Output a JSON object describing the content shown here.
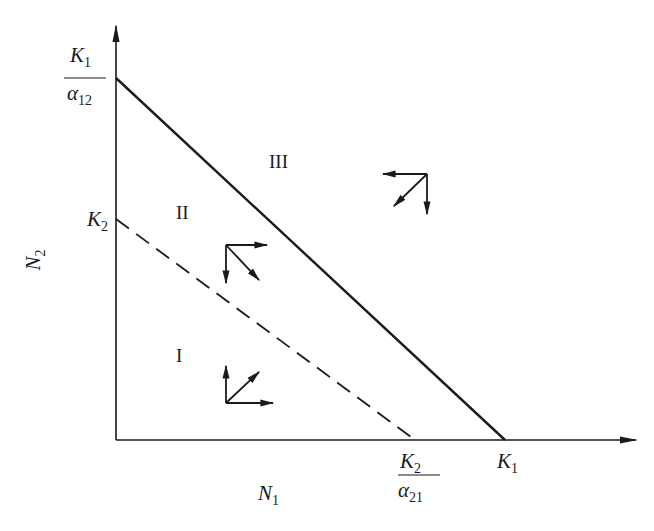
{
  "diagram": {
    "type": "phase-plane",
    "axes": {
      "x_label": "N",
      "x_label_sub": "1",
      "y_label": "N",
      "y_label_sub": "2"
    },
    "y_intercepts": {
      "solid": {
        "num": "K",
        "num_sub": "1",
        "den": "α",
        "den_sub": "12"
      },
      "dashed": {
        "text": "K",
        "sub": "2"
      }
    },
    "x_intercepts": {
      "dashed": {
        "num": "K",
        "num_sub": "2",
        "den": "α",
        "den_sub": "21"
      },
      "solid": {
        "text": "K",
        "sub": "1"
      }
    },
    "regions": [
      {
        "id": "I",
        "label": "I"
      },
      {
        "id": "II",
        "label": "II"
      },
      {
        "id": "III",
        "label": "III"
      }
    ],
    "lines": [
      {
        "name": "species-2-isocline",
        "style": "solid",
        "from": "K1/α12",
        "to": "K1"
      },
      {
        "name": "species-1-isocline",
        "style": "dashed",
        "from": "K2",
        "to": "K2/α21"
      }
    ],
    "vector_groups": [
      {
        "region": "I",
        "vectors": [
          "up",
          "right",
          "up-right"
        ]
      },
      {
        "region": "II",
        "vectors": [
          "right",
          "down",
          "down-right"
        ]
      },
      {
        "region": "III",
        "vectors": [
          "left",
          "down",
          "down-left"
        ]
      }
    ],
    "colors": {
      "ink": "#1a1a1a",
      "background": "#ffffff"
    }
  }
}
